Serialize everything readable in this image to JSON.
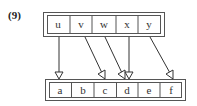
{
  "figure_label": "(9)",
  "top_array": {
    "cells": [
      "u",
      "v",
      "w",
      "x",
      "y"
    ]
  },
  "bottom_array": {
    "cells": [
      "a",
      "b",
      "c",
      "d",
      "e",
      "f"
    ]
  },
  "arrows": [
    {
      "from": "u",
      "to": "a"
    },
    {
      "from": "v",
      "to": "c"
    },
    {
      "from": "w",
      "to": "d"
    },
    {
      "from": "x",
      "to": "d"
    },
    {
      "from": "y",
      "to": "f"
    }
  ]
}
